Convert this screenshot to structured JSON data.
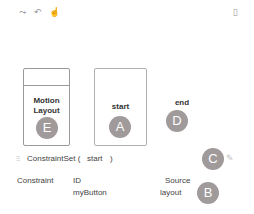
{
  "toolbar": {
    "icons": [
      {
        "name": "create-transition-icon",
        "glyph": "⤳"
      },
      {
        "name": "create-click-handler-icon",
        "glyph": "↶"
      },
      {
        "name": "create-gesture-icon",
        "glyph": "☝"
      }
    ],
    "right_icon": {
      "name": "selected-item-icon",
      "glyph": "▯"
    }
  },
  "overview": {
    "motion_layout": {
      "label_line1": "Motion",
      "label_line2": "Layout",
      "badge": "E"
    },
    "start": {
      "label": "start",
      "badge": "A"
    },
    "end": {
      "label": "end",
      "badge": "D"
    }
  },
  "selection": {
    "title_prefix": "ConstraintSet (",
    "title_name": "start",
    "title_suffix": ")",
    "badge": "C",
    "edit_icon": "✎"
  },
  "table": {
    "columns": [
      "Constraint",
      "ID",
      "Source"
    ],
    "rows": [
      {
        "constraint": "",
        "id": "myButton",
        "source": "layout"
      }
    ],
    "badge": "B"
  },
  "colors": {
    "badge": "#a09a9a",
    "border": "#9a9a9a"
  }
}
